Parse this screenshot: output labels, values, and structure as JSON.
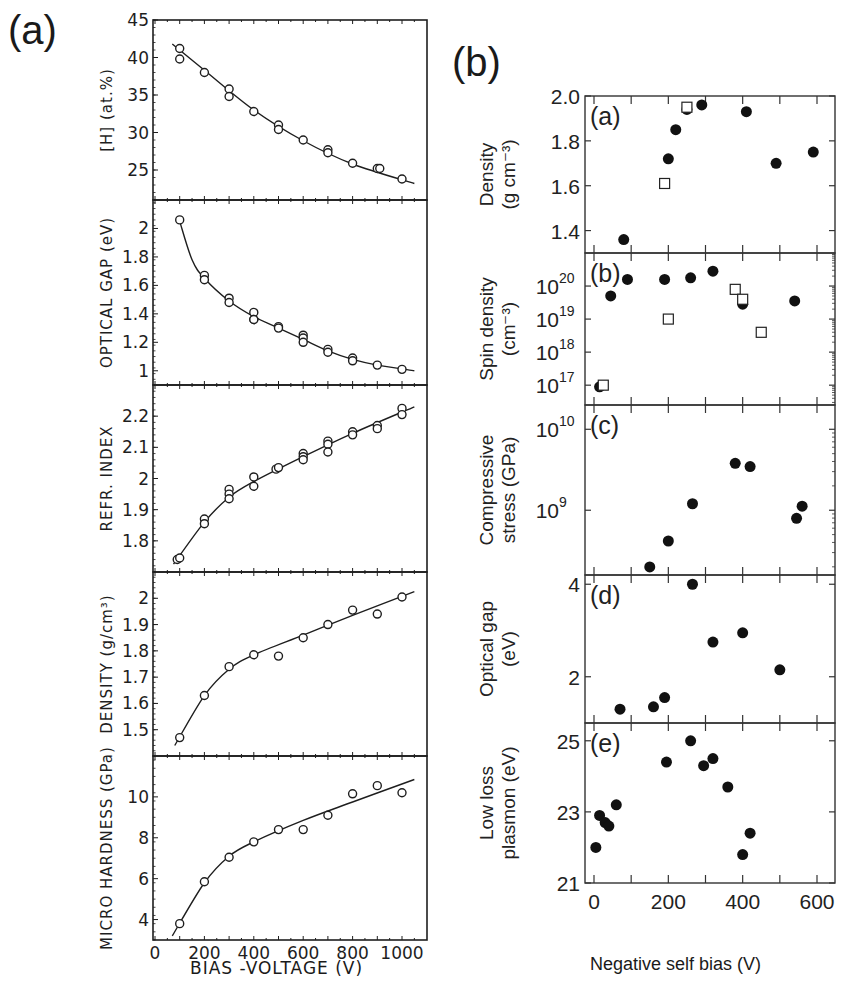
{
  "figure": {
    "panel_a_label": "(a)",
    "panel_b_label": "(b)",
    "panel_a_xlabel": "BIAS -VOLTAGE (V)",
    "panel_b_xlabel": "Negative self bias (V)"
  },
  "chart_data": [
    {
      "type": "scatter",
      "panel": "a",
      "subplot": 1,
      "ylabel": "[H] (at.%)",
      "xlabel": "BIAS -VOLTAGE (V)",
      "xlim": [
        0,
        1050
      ],
      "ylim": [
        21,
        45
      ],
      "yticks": [
        25,
        30,
        35,
        40,
        45
      ],
      "marker": "open-circle",
      "fit_line": true,
      "x": [
        100,
        100,
        200,
        300,
        300,
        400,
        500,
        500,
        600,
        700,
        700,
        800,
        900,
        910,
        1000
      ],
      "y": [
        41.2,
        39.8,
        38.0,
        35.8,
        34.8,
        32.8,
        31.0,
        30.4,
        29.0,
        27.7,
        27.3,
        25.9,
        25.2,
        25.2,
        23.8
      ],
      "fit": {
        "x": [
          70,
          200,
          400,
          600,
          800,
          1050
        ],
        "y": [
          41.8,
          38.3,
          33.0,
          28.9,
          25.8,
          23.2
        ]
      }
    },
    {
      "type": "scatter",
      "panel": "a",
      "subplot": 2,
      "ylabel": "OPTICAL GAP (eV)",
      "xlabel": "BIAS -VOLTAGE (V)",
      "xlim": [
        0,
        1050
      ],
      "ylim": [
        0.9,
        2.2
      ],
      "yticks": [
        1.0,
        1.2,
        1.4,
        1.6,
        1.8,
        2.0
      ],
      "marker": "open-circle",
      "fit_line": true,
      "x": [
        100,
        200,
        200,
        300,
        300,
        400,
        400,
        400,
        500,
        500,
        600,
        600,
        600,
        700,
        700,
        800,
        800,
        900,
        1000
      ],
      "y": [
        2.06,
        1.67,
        1.64,
        1.51,
        1.48,
        1.41,
        1.36,
        1.36,
        1.31,
        1.3,
        1.25,
        1.23,
        1.2,
        1.15,
        1.13,
        1.09,
        1.07,
        1.04,
        1.01
      ],
      "fit": {
        "x": [
          100,
          150,
          200,
          300,
          400,
          500,
          600,
          700,
          800,
          900,
          1050
        ],
        "y": [
          2.05,
          1.78,
          1.65,
          1.49,
          1.38,
          1.3,
          1.22,
          1.14,
          1.08,
          1.04,
          1.0
        ]
      }
    },
    {
      "type": "scatter",
      "panel": "a",
      "subplot": 3,
      "ylabel": "REFR. INDEX",
      "xlabel": "BIAS -VOLTAGE (V)",
      "xlim": [
        0,
        1050
      ],
      "ylim": [
        1.7,
        2.3
      ],
      "yticks": [
        1.8,
        1.9,
        2.0,
        2.1,
        2.2
      ],
      "marker": "open-circle",
      "fit_line": true,
      "x": [
        90,
        100,
        200,
        200,
        300,
        300,
        300,
        400,
        400,
        490,
        500,
        600,
        600,
        600,
        700,
        700,
        700,
        800,
        800,
        900,
        900,
        1000,
        1000
      ],
      "y": [
        1.74,
        1.745,
        1.87,
        1.855,
        1.965,
        1.95,
        1.935,
        2.005,
        1.975,
        2.03,
        2.035,
        2.08,
        2.07,
        2.06,
        2.12,
        2.11,
        2.085,
        2.15,
        2.14,
        2.17,
        2.16,
        2.225,
        2.205
      ],
      "fit": {
        "x": [
          75,
          200,
          300,
          400,
          600,
          800,
          1050
        ],
        "y": [
          1.725,
          1.86,
          1.94,
          1.99,
          2.07,
          2.145,
          2.23
        ]
      }
    },
    {
      "type": "scatter",
      "panel": "a",
      "subplot": 4,
      "ylabel": "DENSITY (g/cm³)",
      "xlabel": "BIAS -VOLTAGE (V)",
      "xlim": [
        0,
        1050
      ],
      "ylim": [
        1.4,
        2.1
      ],
      "yticks": [
        1.5,
        1.6,
        1.7,
        1.8,
        1.9,
        2.0
      ],
      "marker": "open-circle",
      "fit_line": true,
      "x": [
        100,
        200,
        300,
        400,
        500,
        600,
        700,
        800,
        900,
        1000
      ],
      "y": [
        1.47,
        1.63,
        1.74,
        1.785,
        1.78,
        1.85,
        1.9,
        1.955,
        1.94,
        2.005
      ],
      "fit": {
        "x": [
          80,
          200,
          300,
          400,
          600,
          800,
          1050
        ],
        "y": [
          1.44,
          1.63,
          1.73,
          1.785,
          1.86,
          1.935,
          2.025
        ]
      }
    },
    {
      "type": "scatter",
      "panel": "a",
      "subplot": 5,
      "ylabel": "MICRO HARDNESS (GPa)",
      "xlabel": "BIAS -VOLTAGE (V)",
      "xlim": [
        0,
        1050
      ],
      "ylim": [
        3,
        12
      ],
      "yticks": [
        4,
        6,
        8,
        10
      ],
      "xticks": [
        0,
        200,
        400,
        600,
        800,
        1000
      ],
      "marker": "open-circle",
      "fit_line": true,
      "x": [
        100,
        200,
        300,
        400,
        500,
        600,
        700,
        800,
        900,
        1000
      ],
      "y": [
        3.8,
        5.85,
        7.05,
        7.8,
        8.4,
        8.4,
        9.1,
        10.15,
        10.55,
        10.2
      ],
      "fit": {
        "x": [
          70,
          200,
          300,
          400,
          600,
          800,
          1050
        ],
        "y": [
          3.2,
          5.8,
          7.1,
          7.8,
          8.85,
          9.75,
          10.85
        ]
      }
    },
    {
      "type": "scatter",
      "panel": "b",
      "subplot": "a",
      "tag": "(a)",
      "ylabel": "Density (g cm⁻³)",
      "xlim": [
        -20,
        650
      ],
      "ylim": [
        1.3,
        2.0
      ],
      "yticks": [
        1.4,
        1.6,
        1.8,
        2.0
      ],
      "series": [
        {
          "name": "filled",
          "marker": "filled-circle",
          "x": [
            80,
            200,
            220,
            250,
            290,
            410,
            490,
            590
          ],
          "y": [
            1.36,
            1.72,
            1.85,
            1.94,
            1.96,
            1.93,
            1.7,
            1.75
          ]
        },
        {
          "name": "open",
          "marker": "open-square",
          "x": [
            190,
            250
          ],
          "y": [
            1.61,
            1.95
          ]
        }
      ]
    },
    {
      "type": "scatter",
      "panel": "b",
      "subplot": "b",
      "tag": "(b)",
      "ylabel": "Spin density (cm⁻³)",
      "yscale": "log",
      "xlim": [
        -20,
        650
      ],
      "ylim_exp": [
        16.4,
        21
      ],
      "yticks": [
        "10^17",
        "10^18",
        "10^19",
        "10^20"
      ],
      "series": [
        {
          "name": "filled",
          "marker": "filled-circle",
          "x": [
            15,
            45,
            90,
            190,
            260,
            320,
            400,
            540
          ],
          "y_exp": [
            16.95,
            19.7,
            20.2,
            20.2,
            20.25,
            20.45,
            19.45,
            19.55
          ]
        },
        {
          "name": "open",
          "marker": "open-square",
          "x": [
            25,
            200,
            380,
            400,
            450
          ],
          "y_exp": [
            17.0,
            19.0,
            19.9,
            19.6,
            18.6
          ]
        }
      ]
    },
    {
      "type": "scatter",
      "panel": "b",
      "subplot": "c",
      "tag": "(c)",
      "ylabel": "Compressive stress (GPa)",
      "yscale": "log",
      "xlim": [
        -20,
        650
      ],
      "ylim_exp": [
        8.2,
        10.3
      ],
      "yticks": [
        "10^9",
        "10^10"
      ],
      "series": [
        {
          "name": "filled",
          "marker": "filled-circle",
          "x": [
            150,
            200,
            265,
            380,
            420,
            545,
            560
          ],
          "y_exp": [
            8.3,
            8.62,
            9.08,
            9.58,
            9.54,
            8.9,
            9.05
          ]
        }
      ]
    },
    {
      "type": "scatter",
      "panel": "b",
      "subplot": "d",
      "tag": "(d)",
      "ylabel": "Optical gap (eV)",
      "xlim": [
        -20,
        650
      ],
      "ylim": [
        1.0,
        4.2
      ],
      "yticks": [
        2,
        4
      ],
      "series": [
        {
          "name": "filled",
          "marker": "filled-circle",
          "x": [
            70,
            160,
            190,
            265,
            320,
            400,
            500
          ],
          "y": [
            1.3,
            1.35,
            1.55,
            4.0,
            2.75,
            2.95,
            2.15
          ]
        }
      ]
    },
    {
      "type": "scatter",
      "panel": "b",
      "subplot": "e",
      "tag": "(e)",
      "ylabel": "Low loss plasmon (eV)",
      "xlim": [
        -20,
        650
      ],
      "ylim": [
        21,
        25.5
      ],
      "yticks": [
        21,
        23,
        25
      ],
      "xticks": [
        0,
        200,
        400,
        600
      ],
      "xlabel": "Negative self bias (V)",
      "series": [
        {
          "name": "filled",
          "marker": "filled-circle",
          "x": [
            5,
            15,
            30,
            40,
            60,
            195,
            260,
            295,
            320,
            360,
            400,
            420
          ],
          "y": [
            22.0,
            22.9,
            22.7,
            22.6,
            23.2,
            24.4,
            25.0,
            24.3,
            24.5,
            23.7,
            21.8,
            22.4
          ]
        }
      ]
    }
  ]
}
